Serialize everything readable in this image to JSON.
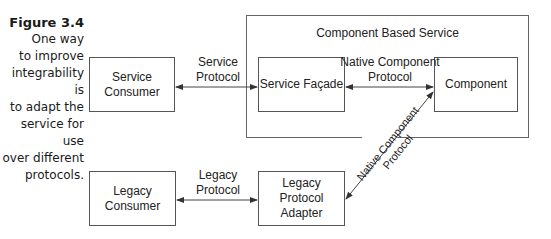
{
  "caption": {
    "figure_label": "Figure 3.4",
    "text_lines": [
      "One way",
      "to improve",
      "integrability is",
      "to adapt the",
      "service for use",
      "over different",
      "protocols."
    ]
  },
  "diagram": {
    "container": {
      "title": "Component Based Service"
    },
    "nodes": {
      "service_consumer": "Service Consumer",
      "service_facade": "Service Façade",
      "component": "Component",
      "legacy_consumer": "Legacy Consumer",
      "legacy_adapter_line1": "Legacy Protocol",
      "legacy_adapter_line2": "Adapter"
    },
    "edges": {
      "service_protocol_line1": "Service",
      "service_protocol_line2": "Protocol",
      "native_protocol_line1": "Native Component",
      "native_protocol_line2": "Protocol",
      "legacy_protocol_line1": "Legacy",
      "legacy_protocol_line2": "Protocol",
      "diagonal_line1": "Native Component",
      "diagonal_line2": "Protocol"
    },
    "colors": {
      "stroke": "#555555",
      "text": "#222222"
    }
  }
}
